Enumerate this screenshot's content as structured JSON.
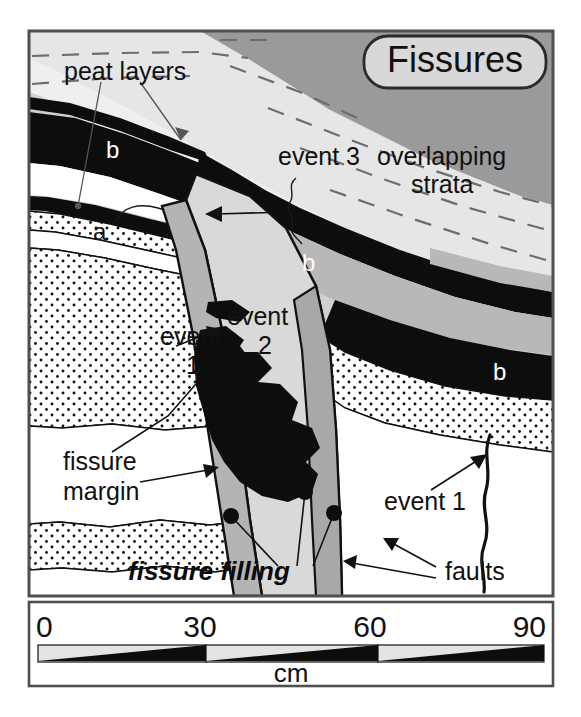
{
  "figure": {
    "title": "Fissures",
    "scale": {
      "ticks": [
        "0",
        "30",
        "60",
        "90"
      ],
      "unit": "cm",
      "segments": 3,
      "max_cm": 90
    },
    "labels": {
      "peat_layers": "peat layers",
      "event_3": "event 3",
      "overlapping_strata_line1": "overlapping",
      "overlapping_strata_line2": "strata",
      "event_line": "event",
      "event_1_num": "1",
      "event_2_num": "2",
      "event_1_right": "event 1",
      "fissure_margin_line1": "fissure",
      "fissure_margin_line2": "margin",
      "fissure_filling": "fissure filling",
      "faults": "faults",
      "peat_a": "a",
      "peat_b_upper": "b",
      "peat_b_middle": "b",
      "peat_b_right": "b"
    },
    "colors": {
      "peat_black": "#0d0d0d",
      "sand_white": "#ffffff",
      "mud_light_gray": "#d0d0d0",
      "mud_mid_gray": "#b2b2b2",
      "mud_dark_gray": "#9a9a9a",
      "fill_gray": "#c4c4c4",
      "frame": "#4f4f4f",
      "text": "#111111",
      "title_box_fill": "#d8d8d8"
    }
  }
}
